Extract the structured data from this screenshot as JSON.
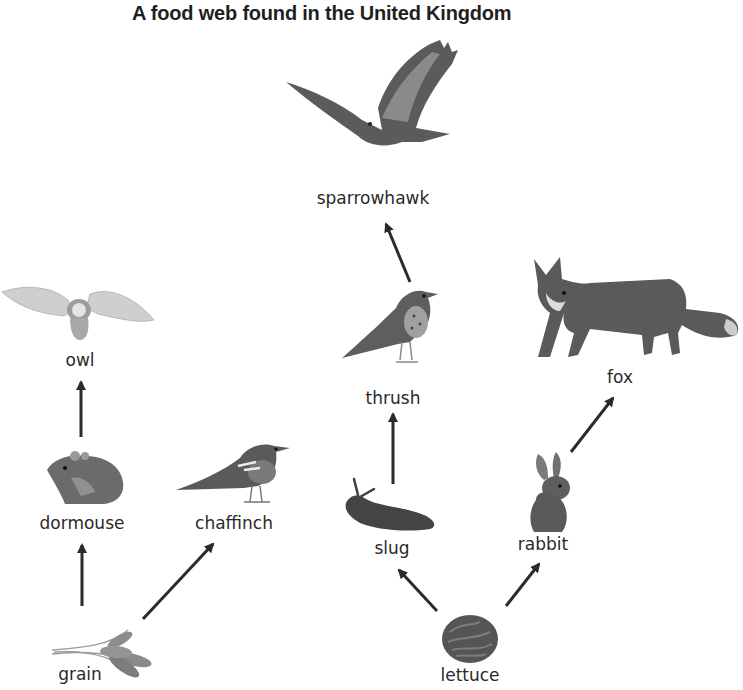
{
  "title": "A food web found in the United Kingdom",
  "organisms": {
    "sparrowhawk": {
      "label": "sparrowhawk",
      "trophic": "tertiary consumer"
    },
    "owl": {
      "label": "owl",
      "trophic": "tertiary consumer"
    },
    "fox": {
      "label": "fox",
      "trophic": "secondary consumer"
    },
    "thrush": {
      "label": "thrush",
      "trophic": "secondary consumer"
    },
    "dormouse": {
      "label": "dormouse",
      "trophic": "primary consumer"
    },
    "chaffinch": {
      "label": "chaffinch",
      "trophic": "primary consumer"
    },
    "slug": {
      "label": "slug",
      "trophic": "primary consumer"
    },
    "rabbit": {
      "label": "rabbit",
      "trophic": "primary consumer"
    },
    "grain": {
      "label": "grain",
      "trophic": "producer"
    },
    "lettuce": {
      "label": "lettuce",
      "trophic": "producer"
    }
  },
  "arrows": [
    {
      "from": "grain",
      "to": "dormouse"
    },
    {
      "from": "grain",
      "to": "chaffinch"
    },
    {
      "from": "dormouse",
      "to": "owl"
    },
    {
      "from": "lettuce",
      "to": "slug"
    },
    {
      "from": "lettuce",
      "to": "rabbit"
    },
    {
      "from": "slug",
      "to": "thrush"
    },
    {
      "from": "thrush",
      "to": "sparrowhawk"
    },
    {
      "from": "rabbit",
      "to": "fox"
    }
  ],
  "colors": {
    "arrow": "#2b2b2b",
    "text": "#2a2a2a",
    "background": "#ffffff"
  }
}
